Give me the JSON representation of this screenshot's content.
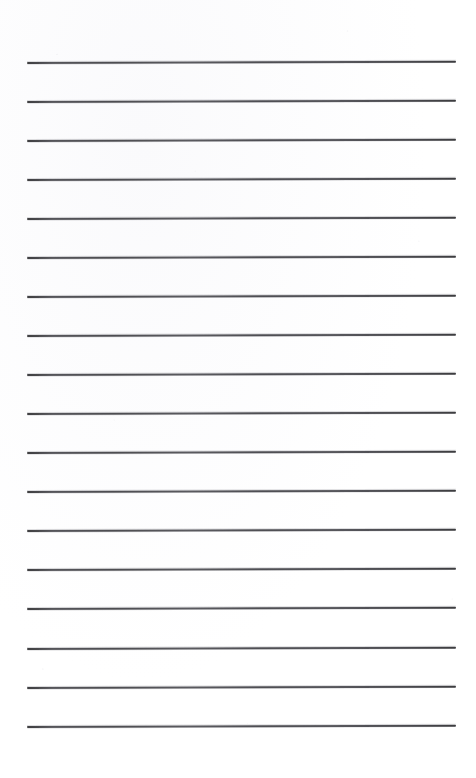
{
  "document": {
    "kind": "lined-paper-scan",
    "title": "Lined notebook page",
    "description": "Blank ruled paper, scanned; no handwriting or printed text present",
    "page_width": 476,
    "page_height": 778,
    "background_color": "#ffffff",
    "rule_color": "#4d4d52",
    "rule_thickness_px": 1.6,
    "rule_count": 18,
    "rule_left_x": 27,
    "rule_right_x": 456,
    "rule_spacing_px": 39,
    "first_rule_y": 62,
    "last_rule_y": 726,
    "skew_degrees": -0.18,
    "margins": {
      "top_blank_px": 62,
      "bottom_blank_px": 52,
      "left_px": 27,
      "right_px": 20
    },
    "text_content": "",
    "rules": [
      {
        "index": 1,
        "y": 62,
        "x1": 27,
        "x2": 456
      },
      {
        "index": 2,
        "y": 101,
        "x1": 27,
        "x2": 456
      },
      {
        "index": 3,
        "y": 140,
        "x1": 27,
        "x2": 456
      },
      {
        "index": 4,
        "y": 179,
        "x1": 27,
        "x2": 456
      },
      {
        "index": 5,
        "y": 218,
        "x1": 27,
        "x2": 456
      },
      {
        "index": 6,
        "y": 257,
        "x1": 27,
        "x2": 456
      },
      {
        "index": 7,
        "y": 296,
        "x1": 27,
        "x2": 456
      },
      {
        "index": 8,
        "y": 335,
        "x1": 27,
        "x2": 456
      },
      {
        "index": 9,
        "y": 374,
        "x1": 27,
        "x2": 456
      },
      {
        "index": 10,
        "y": 413,
        "x1": 27,
        "x2": 456
      },
      {
        "index": 11,
        "y": 452,
        "x1": 27,
        "x2": 456
      },
      {
        "index": 12,
        "y": 491,
        "x1": 27,
        "x2": 456
      },
      {
        "index": 13,
        "y": 530,
        "x1": 27,
        "x2": 456
      },
      {
        "index": 14,
        "y": 569,
        "x1": 27,
        "x2": 456
      },
      {
        "index": 15,
        "y": 608,
        "x1": 27,
        "x2": 456
      },
      {
        "index": 16,
        "y": 648,
        "x1": 27,
        "x2": 456
      },
      {
        "index": 17,
        "y": 687,
        "x1": 27,
        "x2": 456
      },
      {
        "index": 18,
        "y": 726,
        "x1": 27,
        "x2": 456
      }
    ]
  }
}
